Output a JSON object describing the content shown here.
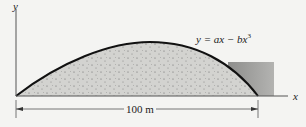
{
  "diagram": {
    "axis_labels": {
      "y": "y",
      "x": "x"
    },
    "curve_equation": {
      "prefix": "y = ax − bx",
      "exponent": "3"
    },
    "dimension_label": "100 m",
    "colors": {
      "fill": "#cfcfcc",
      "block": "#9c9c9a",
      "curve": "#111111",
      "axis": "#555555"
    }
  }
}
